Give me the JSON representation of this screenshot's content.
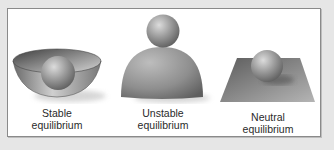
{
  "figure": {
    "panels": [
      {
        "id": "stable",
        "line1": "Stable",
        "line2": "equilibrium"
      },
      {
        "id": "unstable",
        "line1": "Unstable",
        "line2": "equilibrium"
      },
      {
        "id": "neutral",
        "line1": "Neutral",
        "line2": "equilibrium"
      }
    ],
    "colors": {
      "background": "#e6e6e6",
      "panel": "#ffffff",
      "border": "#8a8a8a",
      "object": "#8c8c8c"
    }
  }
}
